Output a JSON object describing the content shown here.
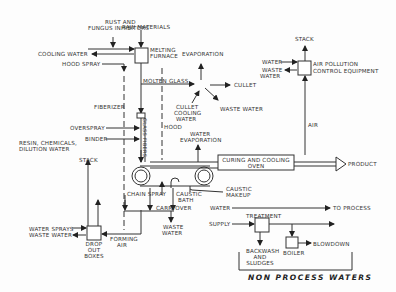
{
  "diagram": {
    "type": "process-flow",
    "labels": {
      "rust": "RUST AND",
      "fungus": "FUNGUS INHIBITORS",
      "raw_materials": "RAW MATERIALS",
      "cooling_water": "COOLING WATER",
      "melting": "MELTING",
      "furnace": "FURNACE",
      "hood_spray": "HOOD SPRAY",
      "evaporation": "EVAPORATION",
      "molten_glass": "MOLTEN GLASS",
      "cullet": "CULLET",
      "waste_water": "WASTE WATER",
      "cullet_cooling_1": "CULLET",
      "cullet_cooling_2": "COOLING",
      "cullet_cooling_3": "WATER",
      "stack_top": "STACK",
      "apc_water": "WATER",
      "apc_waste_1": "WASTE",
      "apc_waste_2": "WATER",
      "apc_1": "AIR POLLUTION",
      "apc_2": "CONTROL EQUIPMENT",
      "air": "AIR",
      "fiberizer": "FIBERIZER",
      "glass_fibers": "GLASS FIBERS",
      "hood": "HOOD",
      "overspray": "OVERSPRAY",
      "binder": "BINDER",
      "resin_1": "RESIN, CHEMICALS,",
      "resin_2": "DILUTION WATER",
      "water_evap_1": "WATER",
      "water_evap_2": "EVAPORATION",
      "oven_1": "CURING AND COOLING",
      "oven_2": "OVEN",
      "product": "PRODUCT",
      "stack_bottom": "STACK",
      "chain_spray": "CHAIN SPRAY",
      "caustic_makeup_1": "CAUSTIC",
      "caustic_makeup_2": "MAKEUP",
      "caustic_bath_1": "CAUSTIC",
      "caustic_bath_2": "BATH",
      "carryover": "CARRYOVER",
      "cw_waste_1": "WASTE",
      "cw_waste_2": "WATER",
      "water_sprays": "WATER SPRAYS",
      "do_waste_water": "WASTE WATER",
      "drop_1": "DROP",
      "drop_2": "OUT",
      "drop_3": "BOXES",
      "forming_1": "FORMING",
      "forming_2": "AIR",
      "npw_water": "WATER",
      "to_process": "TO PROCESS",
      "treatment": "TREATMENT",
      "supply": "SUPPLY",
      "backwash_1": "BACKWASH",
      "backwash_2": "AND",
      "backwash_3": "SLUDGES",
      "boiler": "BOILER",
      "blowdown": "BLOWDOWN",
      "non_process": "NON PROCESS WATERS"
    }
  }
}
